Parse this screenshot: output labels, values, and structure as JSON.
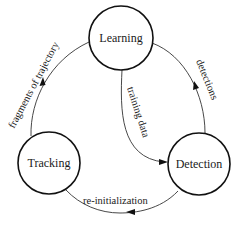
{
  "diagram": {
    "type": "cycle",
    "colors": {
      "background": "#ffffff",
      "node_stroke": "#111111",
      "edge_stroke": "#333333",
      "text": "#1a1a1a"
    },
    "nodes": [
      {
        "id": "learning",
        "label": "Learning"
      },
      {
        "id": "tracking",
        "label": "Tracking"
      },
      {
        "id": "detection",
        "label": "Detection"
      }
    ],
    "edges": [
      {
        "from": "tracking",
        "to": "learning",
        "label": "fragments of trajectory"
      },
      {
        "from": "detection",
        "to": "learning",
        "label": "detections"
      },
      {
        "from": "learning",
        "to": "detection",
        "label": "training data"
      },
      {
        "from": "detection",
        "to": "tracking",
        "label": "re-initialization"
      }
    ]
  }
}
